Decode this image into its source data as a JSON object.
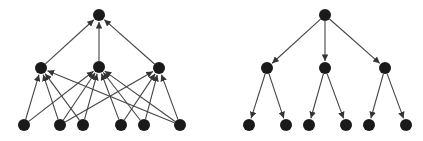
{
  "diagram": {
    "node_color": "#1a1a1a",
    "edge_color": "#444444",
    "node_radius": 6,
    "graphs": [
      {
        "name": "left-graph-converging",
        "direction": "bottom-up",
        "nodes": [
          {
            "id": "top",
            "x": 99,
            "y": 15
          },
          {
            "id": "m1",
            "x": 41,
            "y": 68
          },
          {
            "id": "m2",
            "x": 99,
            "y": 67
          },
          {
            "id": "m3",
            "x": 159,
            "y": 68
          },
          {
            "id": "b1",
            "x": 24,
            "y": 125
          },
          {
            "id": "b2",
            "x": 60,
            "y": 125
          },
          {
            "id": "b3",
            "x": 83,
            "y": 125
          },
          {
            "id": "b4",
            "x": 121,
            "y": 125
          },
          {
            "id": "b5",
            "x": 144,
            "y": 125
          },
          {
            "id": "b6",
            "x": 180,
            "y": 125
          }
        ],
        "edges": [
          [
            "m1",
            "top"
          ],
          [
            "m2",
            "top"
          ],
          [
            "m3",
            "top"
          ],
          [
            "b1",
            "m1"
          ],
          [
            "b1",
            "m2"
          ],
          [
            "b2",
            "m1"
          ],
          [
            "b2",
            "m2"
          ],
          [
            "b2",
            "m3"
          ],
          [
            "b3",
            "m1"
          ],
          [
            "b3",
            "m2"
          ],
          [
            "b4",
            "m2"
          ],
          [
            "b4",
            "m3"
          ],
          [
            "b5",
            "m2"
          ],
          [
            "b5",
            "m3"
          ],
          [
            "b6",
            "m1"
          ],
          [
            "b6",
            "m2"
          ],
          [
            "b6",
            "m3"
          ]
        ]
      },
      {
        "name": "right-graph-tree",
        "direction": "top-down",
        "nodes": [
          {
            "id": "root",
            "x": 325,
            "y": 15
          },
          {
            "id": "c1",
            "x": 267,
            "y": 68
          },
          {
            "id": "c2",
            "x": 325,
            "y": 68
          },
          {
            "id": "c3",
            "x": 385,
            "y": 68
          },
          {
            "id": "l1",
            "x": 249,
            "y": 125
          },
          {
            "id": "l2",
            "x": 286,
            "y": 125
          },
          {
            "id": "l3",
            "x": 309,
            "y": 125
          },
          {
            "id": "l4",
            "x": 346,
            "y": 125
          },
          {
            "id": "l5",
            "x": 369,
            "y": 125
          },
          {
            "id": "l6",
            "x": 406,
            "y": 125
          }
        ],
        "edges": [
          [
            "root",
            "c1"
          ],
          [
            "root",
            "c2"
          ],
          [
            "root",
            "c3"
          ],
          [
            "c1",
            "l1"
          ],
          [
            "c1",
            "l2"
          ],
          [
            "c2",
            "l3"
          ],
          [
            "c2",
            "l4"
          ],
          [
            "c3",
            "l5"
          ],
          [
            "c3",
            "l6"
          ]
        ]
      }
    ]
  }
}
